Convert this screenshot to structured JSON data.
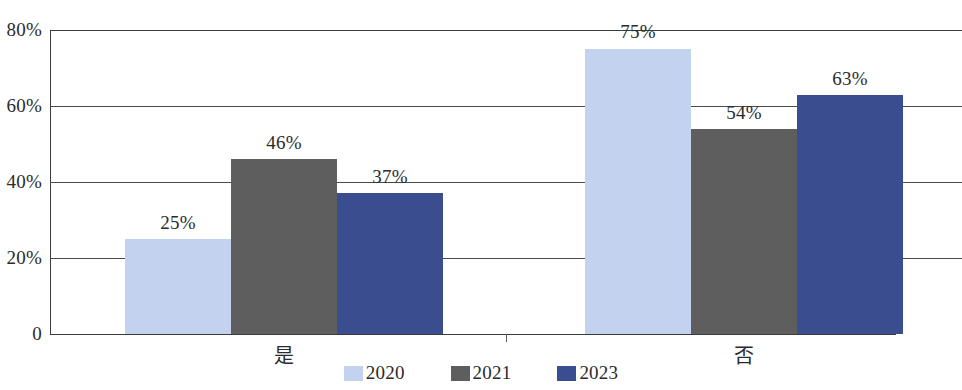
{
  "chart_data": {
    "type": "bar",
    "title": "",
    "subtitle": "",
    "xlabel": "",
    "ylabel": "",
    "categories": [
      "是",
      "否"
    ],
    "series": [
      {
        "name": "2020",
        "color": "#c3d2ee",
        "values": [
          25,
          75
        ],
        "labels": [
          "25%",
          "75%"
        ]
      },
      {
        "name": "2021",
        "color": "#5e5e5e",
        "values": [
          46,
          54
        ],
        "labels": [
          "46%",
          "54%"
        ]
      },
      {
        "name": "2023",
        "color": "#3a4e8f",
        "values": [
          37,
          63
        ],
        "labels": [
          "37%",
          "63%"
        ]
      }
    ],
    "ylim": [
      0,
      80
    ],
    "yticks": [
      0,
      20,
      40,
      60,
      80
    ],
    "ytick_labels": [
      "0",
      "20%",
      "40%",
      "60%",
      "80%"
    ],
    "grid": true,
    "grid_axis": "y",
    "legend_position": "bottom",
    "value_labels": true
  },
  "axis": {
    "y": {
      "ticks": [
        {
          "value": 80,
          "label": "80%"
        },
        {
          "value": 60,
          "label": "60%"
        },
        {
          "value": 40,
          "label": "40%"
        },
        {
          "value": 20,
          "label": "20%"
        },
        {
          "value": 0,
          "label": "0"
        }
      ]
    },
    "x": {
      "categories": [
        {
          "label": "是"
        },
        {
          "label": "否"
        }
      ]
    }
  },
  "bars": [
    {
      "group": 0,
      "series": "2020",
      "value": 25,
      "label": "25%",
      "color": "#c3d2ee"
    },
    {
      "group": 0,
      "series": "2021",
      "value": 46,
      "label": "46%",
      "color": "#5e5e5e"
    },
    {
      "group": 0,
      "series": "2023",
      "value": 37,
      "label": "37%",
      "color": "#3a4e8f"
    },
    {
      "group": 1,
      "series": "2020",
      "value": 75,
      "label": "75%",
      "color": "#c3d2ee"
    },
    {
      "group": 1,
      "series": "2021",
      "value": 54,
      "label": "54%",
      "color": "#5e5e5e"
    },
    {
      "group": 1,
      "series": "2023",
      "value": 63,
      "label": "63%",
      "color": "#3a4e8f"
    }
  ],
  "legend": {
    "items": [
      {
        "label": "2020",
        "color": "#c3d2ee"
      },
      {
        "label": "2021",
        "color": "#5e5e5e"
      },
      {
        "label": "2023",
        "color": "#3a4e8f"
      }
    ]
  }
}
